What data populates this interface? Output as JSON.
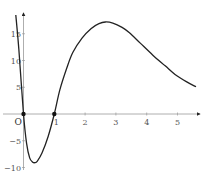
{
  "chart_data": {
    "type": "line",
    "title": "",
    "xlabel": "",
    "ylabel": "",
    "origin_label": "O",
    "xlim": [
      -0.3,
      5.7
    ],
    "ylim": [
      -10.5,
      19
    ],
    "grid": false,
    "legend": null,
    "x_ticks": [
      1,
      2,
      3,
      4,
      5
    ],
    "x_tick_labels": [
      "1",
      "2",
      "3",
      "4",
      "5"
    ],
    "y_ticks": [
      -10,
      -5,
      5,
      10,
      15
    ],
    "y_tick_labels": [
      "−10",
      "−5",
      "5",
      "10",
      "15"
    ],
    "series": [
      {
        "name": "f(x)",
        "color": "#222222",
        "x": [
          -0.25,
          -0.15,
          0.0,
          0.1,
          0.2,
          0.3,
          0.37,
          0.45,
          0.6,
          0.8,
          1.0,
          1.18,
          1.4,
          1.6,
          1.9,
          2.2,
          2.45,
          2.66,
          2.9,
          3.2,
          3.44,
          3.8,
          4.2,
          4.6,
          4.92,
          5.3,
          5.6
        ],
        "y": [
          18.5,
          12.0,
          0.0,
          -5.5,
          -8.2,
          -9.0,
          -9.1,
          -8.8,
          -7.3,
          -4.2,
          0.0,
          4.5,
          8.5,
          11.5,
          14.2,
          16.0,
          16.9,
          17.2,
          17.0,
          16.2,
          15.2,
          13.2,
          11.0,
          9.0,
          7.4,
          6.0,
          5.1
        ]
      }
    ],
    "marked_points": [
      {
        "x": 0,
        "y": 0
      },
      {
        "x": 1,
        "y": 0
      }
    ],
    "annotations": [
      "O"
    ]
  }
}
